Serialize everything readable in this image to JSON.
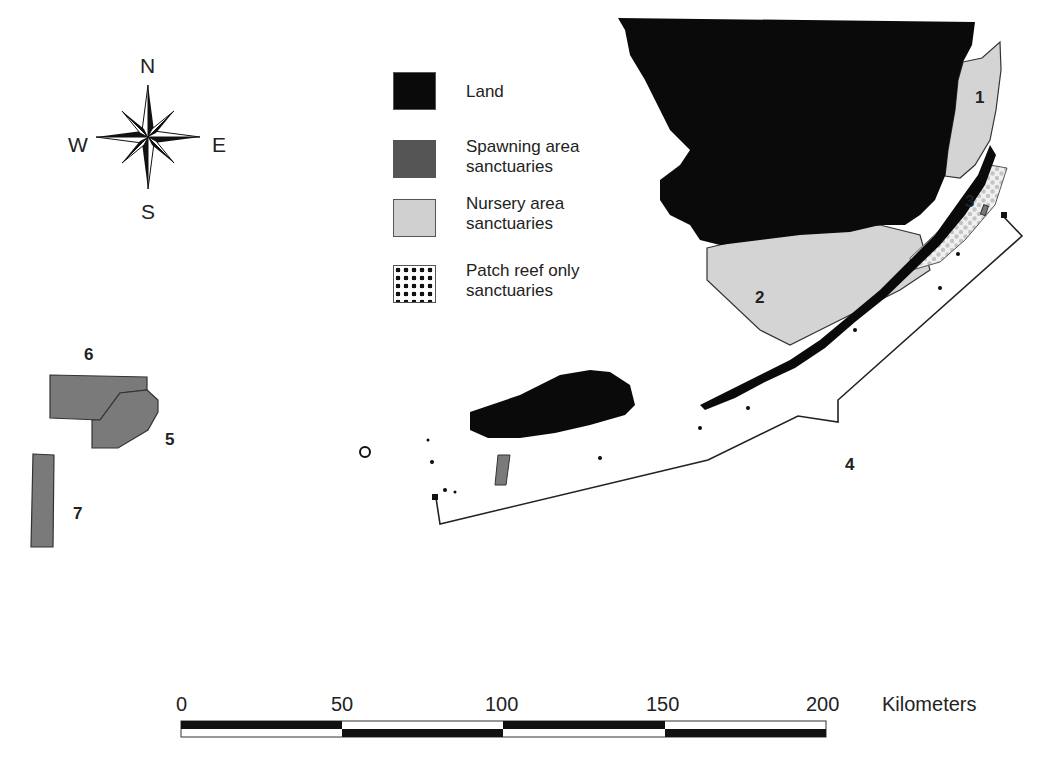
{
  "map": {
    "compass": {
      "north": "N",
      "south": "S",
      "east": "E",
      "west": "W"
    },
    "legend": {
      "items": [
        {
          "label": "Land",
          "pattern": "solid",
          "color": "#0a0a0a"
        },
        {
          "label": "Spawning area sanctuaries",
          "pattern": "solid",
          "color": "#777777"
        },
        {
          "label": "Nursery area sanctuaries",
          "pattern": "solid",
          "color": "#d2d2d2"
        },
        {
          "label": "Patch reef only sanctuaries",
          "pattern": "dots",
          "color": "#111111"
        }
      ]
    },
    "regions": [
      {
        "id": "1",
        "label": "1",
        "type": "Nursery area sanctuaries"
      },
      {
        "id": "2",
        "label": "2",
        "type": "Nursery area sanctuaries"
      },
      {
        "id": "3",
        "label": "3",
        "type": "Patch reef only sanctuaries"
      },
      {
        "id": "4",
        "label": "4",
        "type": "boundary"
      },
      {
        "id": "5",
        "label": "5",
        "type": "Spawning area sanctuaries"
      },
      {
        "id": "6",
        "label": "6",
        "type": "Spawning area sanctuaries"
      },
      {
        "id": "7",
        "label": "7",
        "type": "Spawning area sanctuaries"
      }
    ],
    "scale_bar": {
      "ticks": [
        "0",
        "50",
        "100",
        "150",
        "200"
      ],
      "unit": "Kilometers"
    },
    "colors": {
      "land": "#0a0a0a",
      "spawning": "#7a7a7a",
      "nursery": "#d4d4d4",
      "patch_reef_dots": "#c8c8c8",
      "outline": "#333333"
    }
  }
}
